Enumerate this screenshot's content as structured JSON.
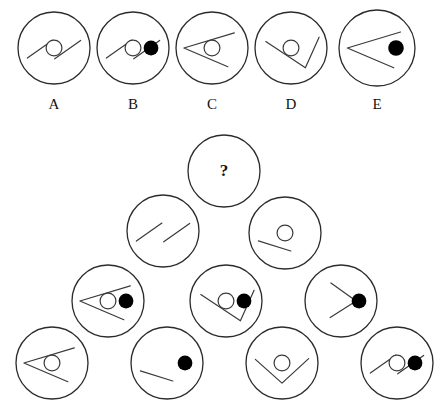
{
  "puzzle": {
    "type": "visual-analogy-matrix",
    "question_mark": "?",
    "style": {
      "stroke_color": "#3a3a3a",
      "circle_stroke_color": "#2b2b2b",
      "dot_fill_color": "#000000",
      "background_color": "#ffffff",
      "stroke_width": 1.2,
      "circle_stroke_width": 1.3
    },
    "options": {
      "labels": [
        "A",
        "B",
        "C",
        "D",
        "E"
      ],
      "items": [
        {
          "label": "A",
          "cx": 54,
          "cy": 48,
          "r": 36,
          "shape": "two-parallel-lines",
          "ring": true,
          "dot": false
        },
        {
          "label": "B",
          "cx": 133,
          "cy": 48,
          "r": 36,
          "shape": "two-parallel-lines",
          "ring": true,
          "dot": true
        },
        {
          "label": "C",
          "cx": 212,
          "cy": 48,
          "r": 36,
          "shape": "chevron-left-diamond",
          "ring": true,
          "dot": false
        },
        {
          "label": "D",
          "cx": 291,
          "cy": 48,
          "r": 36,
          "shape": "chevron-right-diamond",
          "ring": true,
          "dot": false
        },
        {
          "label": "E",
          "cx": 377,
          "cy": 48,
          "r": 38,
          "shape": "chevron-left-diamond",
          "ring": false,
          "dot": true
        }
      ]
    },
    "option_label_y": 97,
    "matrix": {
      "rows": [
        {
          "row_index": 1,
          "cells": [
            {
              "cx": 224,
              "cy": 171,
              "r": 36,
              "shape": "question",
              "ring": false,
              "dot": false
            }
          ]
        },
        {
          "row_index": 2,
          "cells": [
            {
              "cx": 163,
              "cy": 231,
              "r": 36,
              "shape": "two-parallel-lines",
              "ring": false,
              "dot": false
            },
            {
              "cx": 285,
              "cy": 233,
              "r": 36,
              "shape": "single-line",
              "ring": true,
              "dot": false
            }
          ]
        },
        {
          "row_index": 3,
          "cells": [
            {
              "cx": 108,
              "cy": 301,
              "r": 36,
              "shape": "chevron-left-diamond",
              "ring": true,
              "dot": true
            },
            {
              "cx": 226,
              "cy": 301,
              "r": 36,
              "shape": "chevron-right-diamond",
              "ring": true,
              "dot": true
            },
            {
              "cx": 341,
              "cy": 301,
              "r": 36,
              "shape": "chevron-right-open",
              "ring": false,
              "dot": true
            }
          ]
        },
        {
          "row_index": 4,
          "cells": [
            {
              "cx": 52,
              "cy": 363,
              "r": 36,
              "shape": "chevron-left-diamond",
              "ring": true,
              "dot": false
            },
            {
              "cx": 167,
              "cy": 363,
              "r": 36,
              "shape": "single-line",
              "ring": false,
              "dot": true
            },
            {
              "cx": 282,
              "cy": 363,
              "r": 36,
              "shape": "chevron-down",
              "ring": true,
              "dot": false
            },
            {
              "cx": 397,
              "cy": 363,
              "r": 36,
              "shape": "two-parallel-lines",
              "ring": true,
              "dot": true
            }
          ]
        }
      ]
    }
  }
}
